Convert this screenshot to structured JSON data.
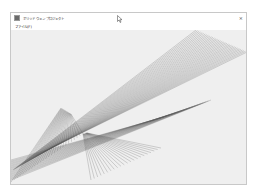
{
  "window": {
    "title": "ポリッド ウェン プロジェクト",
    "close_label": "×",
    "app_icon": "window-icon"
  },
  "menubar": {
    "items": [
      {
        "label": "ファイル(F)"
      }
    ]
  },
  "canvas": {
    "line_color": "#555555",
    "background": "#efefef",
    "fans": [
      {
        "name": "main-band",
        "from": [
          [
            2,
            140
          ],
          [
            40,
            118
          ]
        ],
        "to": [
          [
            185,
            0
          ],
          [
            236,
            22
          ]
        ],
        "count": 34
      },
      {
        "name": "upper-left-fan",
        "from": [
          [
            50,
            78
          ],
          [
            60,
            84
          ]
        ],
        "to": [
          [
            0,
            152
          ],
          [
            72,
            104
          ]
        ],
        "count": 26
      },
      {
        "name": "lower-right-rays",
        "from": [
          [
            72,
            104
          ],
          [
            76,
            103
          ]
        ],
        "to": [
          [
            80,
            150
          ],
          [
            150,
            118
          ]
        ],
        "count": 22
      },
      {
        "name": "lower-left-band",
        "from": [
          [
            0,
            130
          ],
          [
            0,
            150
          ]
        ],
        "to": [
          [
            150,
            88
          ],
          [
            200,
            70
          ]
        ],
        "count": 20
      }
    ]
  },
  "cursor": {
    "icon": "mouse-pointer-icon"
  }
}
